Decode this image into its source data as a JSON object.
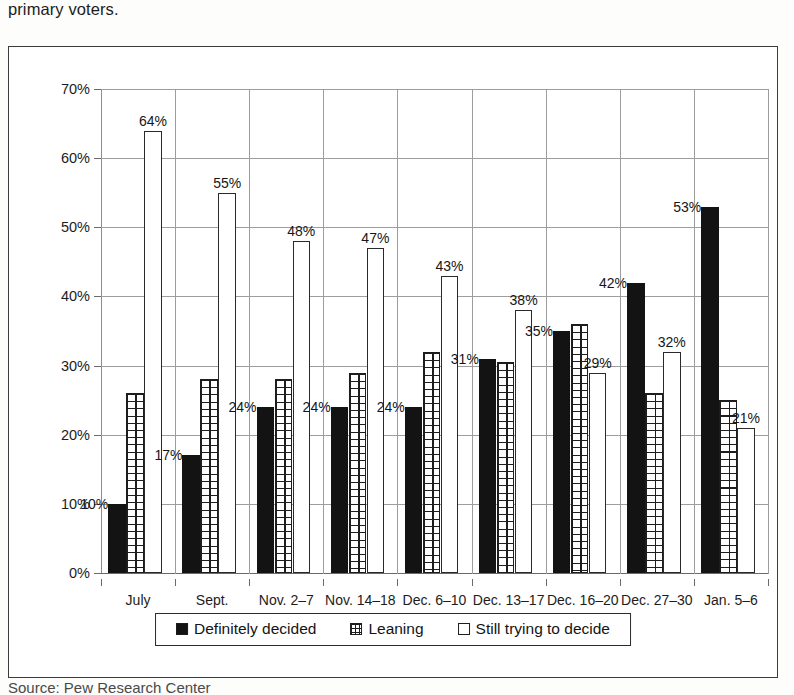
{
  "caption_above": "primary voters.",
  "caption_below": "Source: Pew Research Center",
  "chart_data": {
    "type": "bar",
    "title": "",
    "subtitle": "",
    "xlabel": "",
    "ylabel": "",
    "ylim": [
      0,
      70
    ],
    "ytick_step": 10,
    "ytick_labels": [
      "0%",
      "10%",
      "20%",
      "30%",
      "40%",
      "50%",
      "60%",
      "70%"
    ],
    "ytick_values": [
      0,
      10,
      20,
      30,
      40,
      50,
      60,
      70
    ],
    "grid": true,
    "legend_position": "bottom",
    "value_suffix": "%",
    "categories": [
      "July",
      "Sept.",
      "Nov. 2–7",
      "Nov. 14–18",
      "Dec. 6–10",
      "Dec. 13–17",
      "Dec. 16–20",
      "Dec. 27–30",
      "Jan. 5–6"
    ],
    "series": [
      {
        "name": "Definitely decided",
        "pattern": "solid",
        "values": [
          10,
          17,
          24,
          24,
          24,
          31,
          35,
          42,
          53
        ],
        "labels": [
          "10%",
          "17%",
          "24%",
          "24%",
          "24%",
          "31%",
          "35%",
          "42%",
          "53%"
        ],
        "labels_shown": [
          true,
          true,
          true,
          true,
          true,
          true,
          true,
          true,
          true
        ]
      },
      {
        "name": "Leaning",
        "pattern": "grid",
        "values": [
          26,
          28,
          28,
          29,
          32,
          30.5,
          36,
          26,
          25
        ],
        "labels": [
          "",
          "",
          "",
          "",
          "",
          "",
          "",
          "",
          ""
        ],
        "labels_shown": [
          false,
          false,
          false,
          false,
          false,
          false,
          false,
          false,
          false
        ]
      },
      {
        "name": "Still trying to decide",
        "pattern": "open",
        "values": [
          64,
          55,
          48,
          47,
          43,
          38,
          29,
          32,
          21
        ],
        "labels": [
          "64%",
          "55%",
          "48%",
          "47%",
          "43%",
          "38%",
          "29%",
          "32%",
          "21%"
        ],
        "labels_shown": [
          true,
          true,
          true,
          true,
          true,
          true,
          true,
          true,
          true
        ]
      }
    ]
  },
  "legend": {
    "items": [
      {
        "label": "Definitely decided",
        "pattern": "solid"
      },
      {
        "label": "Leaning",
        "pattern": "grid"
      },
      {
        "label": "Still trying to decide",
        "pattern": "open"
      }
    ]
  }
}
